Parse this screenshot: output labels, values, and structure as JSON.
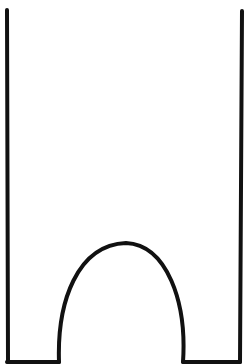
{
  "diagram": {
    "stroke_color": "#111111",
    "background_color": "#ffffff",
    "stroke_width": 4,
    "elements": {
      "left_wall": {
        "x1": 7,
        "y1": 10,
        "x2": 8,
        "y2": 362
      },
      "right_wall": {
        "x1": 242,
        "y1": 11,
        "x2": 240,
        "y2": 362
      },
      "bottom_left_segment": {
        "x1": 7,
        "y1": 362,
        "x2": 59,
        "y2": 362
      },
      "bottom_right_segment": {
        "x1": 183,
        "y1": 362,
        "x2": 240,
        "y2": 362
      },
      "arch": {
        "start": [
          59,
          362
        ],
        "apex": [
          126,
          243
        ],
        "end": [
          183,
          362
        ]
      }
    }
  }
}
